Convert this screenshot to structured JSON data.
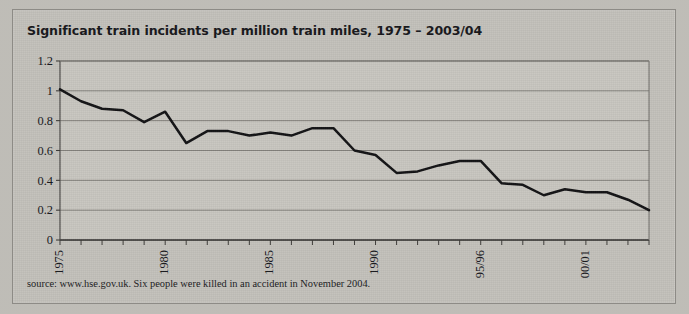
{
  "page": {
    "background_color": "#bcbab4",
    "card_color": "#c3c1bb"
  },
  "title": "Significant train incidents per million train miles, 1975 – 2003/04",
  "source_note": "source: www.hse.gov.uk. Six people were killed in an accident in November 2004.",
  "chart_data": {
    "type": "line",
    "title": "Significant train incidents per million train miles, 1975 – 2003/04",
    "xlabel": "",
    "ylabel": "",
    "line_color": "#121214",
    "grid": true,
    "grid_color": "#6e6c68",
    "legend": "none",
    "ylim": [
      0,
      1.2
    ],
    "yticks": [
      "0",
      "0.2",
      "0.4",
      "0.6",
      "0.8",
      "1",
      "1.2"
    ],
    "ytick_values": [
      0,
      0.2,
      0.4,
      0.6,
      0.8,
      1,
      1.2
    ],
    "xtick_labels": [
      "1975",
      "1980",
      "1985",
      "1990",
      "95/96",
      "00/01"
    ],
    "xtick_label_years": [
      1975,
      1980,
      1985,
      1990,
      1995,
      2000
    ],
    "x": [
      1975,
      1976,
      1977,
      1978,
      1979,
      1980,
      1981,
      1982,
      1983,
      1984,
      1985,
      1986,
      1987,
      1988,
      1989,
      1990,
      1991,
      1992,
      1993,
      1994,
      1995,
      1996,
      1997,
      1998,
      1999,
      2000,
      2001,
      2002,
      2003
    ],
    "x_labels": [
      "1975",
      "1976",
      "1977",
      "1978",
      "1979",
      "1980",
      "1981",
      "1982",
      "1983",
      "1984",
      "1985",
      "1986",
      "1987",
      "1988",
      "1989",
      "1990",
      "1991",
      "1992",
      "1993",
      "1994",
      "94/95",
      "95/96",
      "96/97",
      "97/98",
      "98/99",
      "99/00",
      "00/01",
      "01/02",
      "02/03"
    ],
    "values": [
      1.01,
      0.93,
      0.88,
      0.87,
      0.79,
      0.86,
      0.65,
      0.73,
      0.73,
      0.7,
      0.72,
      0.7,
      0.75,
      0.75,
      0.6,
      0.57,
      0.45,
      0.46,
      0.5,
      0.53,
      0.53,
      0.38,
      0.37,
      0.3,
      0.34,
      0.32,
      0.32,
      0.27,
      0.2
    ],
    "n_points": 29
  },
  "axis": {
    "y_tick_labels": [
      "1.2",
      "1",
      "0.8",
      "0.6",
      "0.4",
      "0.2",
      "0"
    ],
    "x_tick_labels": [
      "1975",
      "1980",
      "1985",
      "1990",
      "95/96",
      "00/01"
    ]
  }
}
